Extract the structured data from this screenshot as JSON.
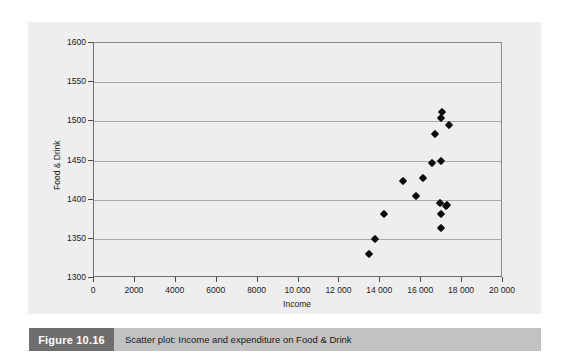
{
  "figure": {
    "tag": "Figure 10.16",
    "caption": "Scatter plot: Income and expenditure on Food & Drink"
  },
  "colors": {
    "panel_background": "#eeeeee",
    "gridline": "#a9a9a9",
    "axis": "#6d6d6d",
    "marker": "#0d0d0d",
    "caption_bar": "#c2c2c2",
    "caption_tag": "#6e6e6e"
  },
  "chart_data": {
    "type": "scatter",
    "title": "",
    "xlabel": "Income",
    "ylabel": "Food & Drink",
    "xlim": [
      0,
      20000
    ],
    "ylim": [
      1300,
      1600
    ],
    "xticks": [
      0,
      2000,
      4000,
      6000,
      8000,
      10000,
      12000,
      14000,
      16000,
      18000,
      20000
    ],
    "xtick_labels": [
      "0",
      "2000",
      "4000",
      "6000",
      "8000",
      "10 000",
      "12 000",
      "14 000",
      "16 000",
      "18 000",
      "20 000"
    ],
    "yticks": [
      1300,
      1350,
      1400,
      1450,
      1500,
      1550,
      1600
    ],
    "ytick_labels": [
      "1300",
      "1350",
      "1400",
      "1450",
      "1500",
      "1550",
      "1600"
    ],
    "grid": "horizontal",
    "legend": "none",
    "marker": "filled-diamond",
    "points": [
      {
        "x": 13500,
        "y": 1330
      },
      {
        "x": 13800,
        "y": 1348
      },
      {
        "x": 14250,
        "y": 1380
      },
      {
        "x": 15150,
        "y": 1422
      },
      {
        "x": 15800,
        "y": 1404
      },
      {
        "x": 16150,
        "y": 1426
      },
      {
        "x": 16600,
        "y": 1446
      },
      {
        "x": 16700,
        "y": 1483
      },
      {
        "x": 17000,
        "y": 1503
      },
      {
        "x": 17050,
        "y": 1511
      },
      {
        "x": 17000,
        "y": 1448
      },
      {
        "x": 16950,
        "y": 1394
      },
      {
        "x": 17250,
        "y": 1391
      },
      {
        "x": 17320,
        "y": 1392
      },
      {
        "x": 17000,
        "y": 1380
      },
      {
        "x": 17000,
        "y": 1362
      },
      {
        "x": 17400,
        "y": 1494
      }
    ]
  }
}
